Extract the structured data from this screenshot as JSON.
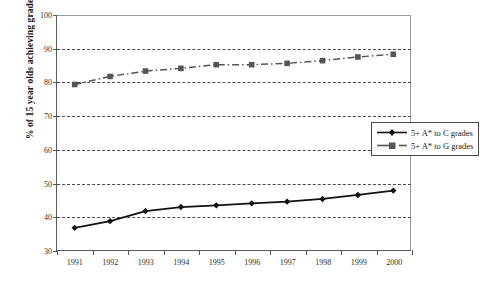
{
  "chart_data": {
    "type": "line",
    "title": "",
    "xlabel": "",
    "ylabel": "% of 15 year olds achieving grades",
    "categories": [
      "1991",
      "1992",
      "1993",
      "1994",
      "1995",
      "1996",
      "1997",
      "1998",
      "1999",
      "2000"
    ],
    "ylim": [
      30,
      100
    ],
    "ytick_labels": [
      "30",
      "40",
      "50",
      "60",
      "70",
      "80",
      "90",
      "100"
    ],
    "ytick_values": [
      30,
      40,
      50,
      60,
      70,
      80,
      90,
      100
    ],
    "grid": "horizontal-dashed",
    "legend_position": "right-inside",
    "series": [
      {
        "name": "5+ A* to C grades",
        "marker": "diamond",
        "line_style": "solid",
        "color": "#111111",
        "values": [
          36.6,
          38.6,
          41.6,
          42.8,
          43.3,
          43.9,
          44.4,
          45.2,
          46.4,
          47.7
        ]
      },
      {
        "name": "5+ A* to G grades",
        "marker": "square",
        "line_style": "dash-dot",
        "color": "#555555",
        "values": [
          79.3,
          81.7,
          83.3,
          84.1,
          85.2,
          85.2,
          85.6,
          86.4,
          87.5,
          88.3
        ]
      }
    ]
  },
  "legend": {
    "items": [
      {
        "label": "5+ A* to C grades"
      },
      {
        "label": "5+ A* to G grades"
      }
    ]
  }
}
